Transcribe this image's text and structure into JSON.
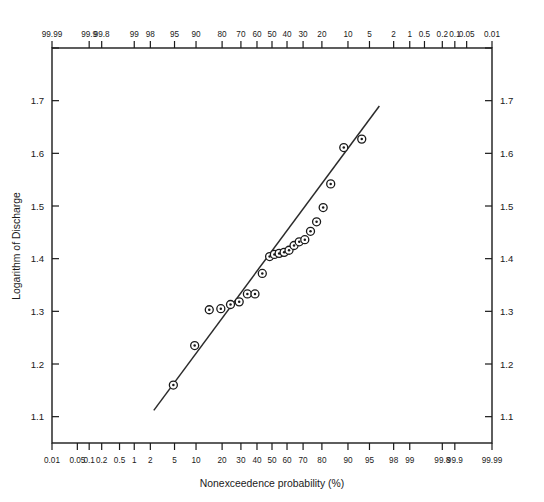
{
  "chart": {
    "type": "scatter",
    "title": "",
    "xlabel": "Nonexceedence probability (%)",
    "ylabel": "Logarithm of Discharge",
    "frame": {
      "left": 52,
      "right": 492,
      "top": 48,
      "bottom": 443
    }
  },
  "chart_data": {
    "type": "scatter",
    "title": "",
    "xlabel": "Nonexceedence probability (%)",
    "ylabel": "Logarithm of Discharge",
    "x_scale": "normal-probability",
    "x_axis_direction": "increasing-left-to-right",
    "xlim": [
      0.01,
      99.99
    ],
    "ylim": [
      1.05,
      1.8
    ],
    "grid": false,
    "legend": null,
    "bottom_tick_labels": [
      "0.01",
      "0.05",
      "0.1",
      "0.2",
      "0.5",
      "1",
      "2",
      "5",
      "10",
      "20",
      "30",
      "40",
      "50",
      "60",
      "70",
      "80",
      "90",
      "95",
      "98",
      "99",
      "99.8",
      "99.9",
      "99.99"
    ],
    "top_tick_labels": [
      "99.99",
      "99.9",
      "99.8",
      "99",
      "98",
      "95",
      "90",
      "80",
      "70",
      "60",
      "50",
      "40",
      "30",
      "20",
      "10",
      "5",
      "2",
      "1",
      "0.5",
      "0.2",
      "0.1",
      "0.05",
      "0.01"
    ],
    "y_tick_labels": [
      "1.1",
      "1.2",
      "1.3",
      "1.4",
      "1.5",
      "1.6",
      "1.7"
    ],
    "y_tick_values": [
      1.1,
      1.2,
      1.3,
      1.4,
      1.5,
      1.6,
      1.7
    ],
    "y_unlabeled_ticks": [
      1.8
    ],
    "series": [
      {
        "name": "Observed data",
        "marker": "circle-with-center-dot",
        "points": [
          {
            "p": 4.8,
            "y": 1.16
          },
          {
            "p": 9.6,
            "y": 1.235
          },
          {
            "p": 14.5,
            "y": 1.303
          },
          {
            "p": 19.4,
            "y": 1.305
          },
          {
            "p": 24.2,
            "y": 1.313
          },
          {
            "p": 29.0,
            "y": 1.318
          },
          {
            "p": 33.9,
            "y": 1.333
          },
          {
            "p": 38.7,
            "y": 1.333
          },
          {
            "p": 43.5,
            "y": 1.372
          },
          {
            "p": 48.4,
            "y": 1.404
          },
          {
            "p": 51.6,
            "y": 1.408
          },
          {
            "p": 54.8,
            "y": 1.41
          },
          {
            "p": 58.1,
            "y": 1.412
          },
          {
            "p": 61.3,
            "y": 1.416
          },
          {
            "p": 64.5,
            "y": 1.425
          },
          {
            "p": 67.7,
            "y": 1.432
          },
          {
            "p": 71.0,
            "y": 1.436
          },
          {
            "p": 74.2,
            "y": 1.452
          },
          {
            "p": 77.4,
            "y": 1.47
          },
          {
            "p": 80.6,
            "y": 1.497
          },
          {
            "p": 83.9,
            "y": 1.542
          },
          {
            "p": 88.7,
            "y": 1.611
          },
          {
            "p": 93.5,
            "y": 1.627
          }
        ]
      }
    ],
    "fit_line": {
      "name": "Fitted frequency curve",
      "endpoints": [
        {
          "p": 2.3,
          "y": 1.112
        },
        {
          "p": 96.5,
          "y": 1.69
        }
      ]
    }
  }
}
